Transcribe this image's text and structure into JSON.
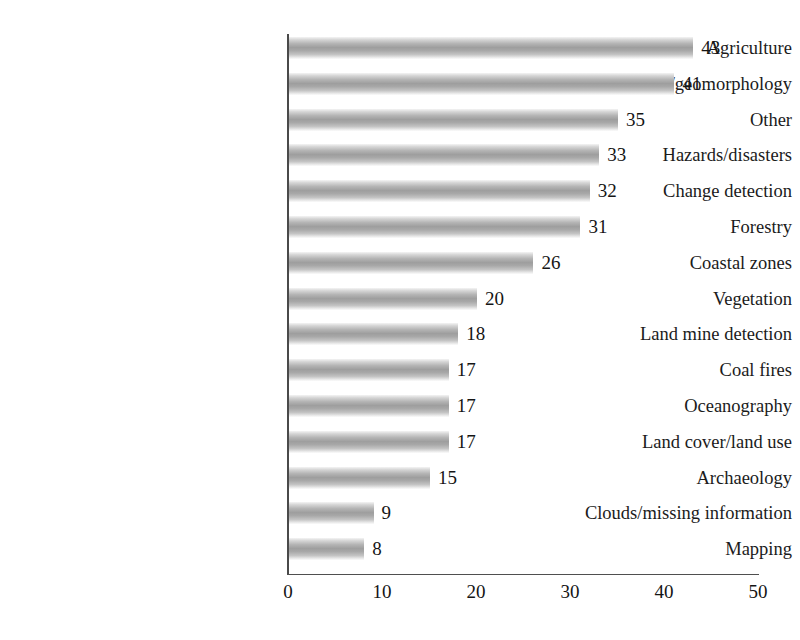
{
  "chart_data": {
    "type": "bar",
    "orientation": "horizontal",
    "title": "",
    "subtitle": "",
    "xlabel": "",
    "ylabel": "",
    "xlim": [
      0,
      50
    ],
    "ylim": null,
    "grid": false,
    "legend": null,
    "legend_position": "none",
    "xticks": [
      "0",
      "10",
      "20",
      "30",
      "40",
      "50"
    ],
    "xtick_values": [
      0,
      10,
      20,
      30,
      40,
      50
    ],
    "categories": [
      "Agriculture",
      "Geology/geomorphology",
      "Other",
      "Hazards/disasters",
      "Change detection",
      "Forestry",
      "Coastal zones",
      "Vegetation",
      "Land mine detection",
      "Coal fires",
      "Oceanography",
      "Land cover/land use",
      "Archaeology",
      "Clouds/missing information",
      "Mapping"
    ],
    "values": [
      43,
      41,
      35,
      33,
      32,
      31,
      26,
      20,
      18,
      17,
      17,
      17,
      15,
      9,
      8
    ],
    "data_labels": [
      "43",
      "41",
      "35",
      "33",
      "32",
      "31",
      "26",
      "20",
      "18",
      "17",
      "17",
      "17",
      "15",
      "9",
      "8"
    ],
    "annotations": []
  },
  "style": {
    "background": "#ffffff",
    "axis_color": "#4a4a4a",
    "text_color": "#1b1b1b",
    "bar_color_light": "#ececec",
    "bar_color_mid": "#9e9e9e"
  }
}
